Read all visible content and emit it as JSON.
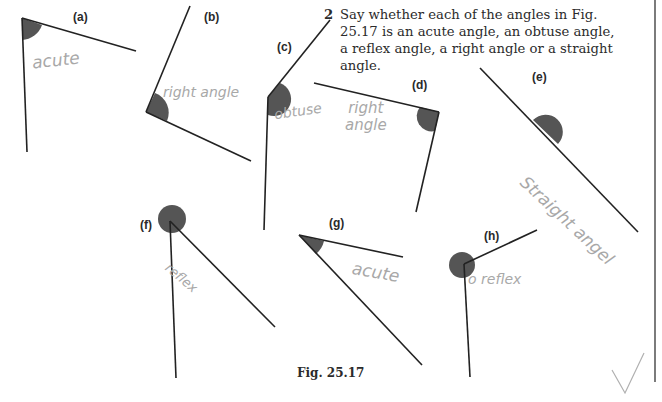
{
  "question": {
    "number": "2",
    "text": "Say whether each of the angles in Fig. 25.17 is an acute angle, an obtuse angle, a reflex angle, a right angle or a straight angle."
  },
  "caption": "Fig. 25.17",
  "colors": {
    "angle_fill": "#555555",
    "line": "#222222",
    "handwriting": "#a8a8a8",
    "margin_line": "#444444"
  },
  "figures": [
    {
      "label": "(a)",
      "answer": "acute"
    },
    {
      "label": "(b)",
      "answer": "right angle"
    },
    {
      "label": "(c)",
      "answer": "obtuse"
    },
    {
      "label": "(d)",
      "answer_line1": "right",
      "answer_line2": "angle"
    },
    {
      "label": "(e)",
      "answer": "Straight angel"
    },
    {
      "label": "(f)",
      "answer": "reflex"
    },
    {
      "label": "(g)",
      "answer": "acute"
    },
    {
      "label": "(h)",
      "answer": "o reflex"
    }
  ],
  "marks": {
    "tick": "✓"
  }
}
